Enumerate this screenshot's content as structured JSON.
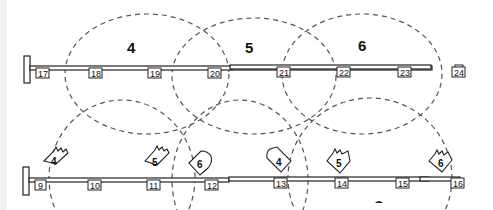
{
  "diagram": {
    "top_bus": {
      "nodes": [
        "17",
        "18",
        "19",
        "20",
        "21",
        "22",
        "23",
        "24"
      ],
      "zones": [
        {
          "label": "4"
        },
        {
          "label": "5"
        },
        {
          "label": "6"
        }
      ]
    },
    "bottom_bus": {
      "nodes": [
        "9",
        "10",
        "11",
        "12",
        "13",
        "14",
        "15",
        "16"
      ],
      "tags": [
        {
          "label": "4",
          "shape": "jagged-diamond"
        },
        {
          "label": "5",
          "shape": "jagged-diamond"
        },
        {
          "label": "6",
          "shape": "rounded-diamond"
        },
        {
          "label": "4",
          "shape": "rounded-diamond"
        },
        {
          "label": "5",
          "shape": "jagged-diamond"
        },
        {
          "label": "6",
          "shape": "jagged-diamond"
        }
      ]
    },
    "colors": {
      "line": "#222222",
      "dash": "#555555",
      "background": "#ffffff",
      "edge_strip": "#f0f0f0"
    }
  }
}
